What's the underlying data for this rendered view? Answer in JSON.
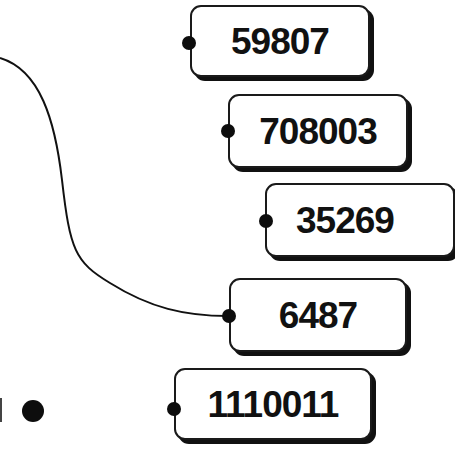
{
  "diagram": {
    "colors": {
      "ink": "#111111",
      "background": "#ffffff",
      "tag_fill": "#ffffff"
    },
    "tags": [
      {
        "id": "tag-1",
        "label": "59807"
      },
      {
        "id": "tag-2",
        "label": "708003"
      },
      {
        "id": "tag-3",
        "label": "35269"
      },
      {
        "id": "tag-4",
        "label": "6487",
        "connected_to_string": true
      },
      {
        "id": "tag-5",
        "label": "1110011"
      }
    ],
    "string": {
      "from": "left edge (top)",
      "to": "tag-4 hole"
    },
    "loose_dot": {
      "present": true
    }
  }
}
